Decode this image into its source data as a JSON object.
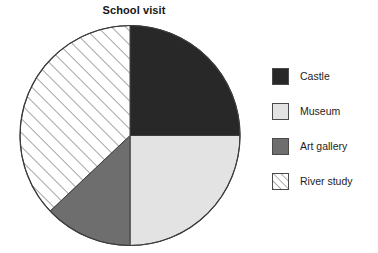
{
  "chart_data": {
    "type": "pie",
    "title": "School visit",
    "categories": [
      "Castle",
      "Museum",
      "Art gallery",
      "River study"
    ],
    "values": [
      25,
      25,
      13,
      37
    ],
    "unit": "percent",
    "total": 100,
    "start_angle_deg": 0,
    "direction": "clockwise",
    "legend_position": "right",
    "grid": false,
    "xlabel": "",
    "ylabel": "",
    "slices": [
      {
        "label": "Castle",
        "value": 25,
        "start_deg": 0,
        "end_deg": 90,
        "fill": "#282828",
        "pattern": "solid",
        "swatch_icon": "solid-dark-swatch-icon"
      },
      {
        "label": "Museum",
        "value": 25,
        "start_deg": 90,
        "end_deg": 180,
        "fill": "#e3e3e3",
        "pattern": "solid",
        "swatch_icon": "solid-light-swatch-icon"
      },
      {
        "label": "Art gallery",
        "value": 13,
        "start_deg": 180,
        "end_deg": 226.6,
        "fill": "#6e6e6e",
        "pattern": "solid",
        "swatch_icon": "solid-mid-swatch-icon"
      },
      {
        "label": "River study",
        "value": 37,
        "start_deg": 226.6,
        "end_deg": 360,
        "fill": "#ffffff",
        "pattern": "diagonal-hatch",
        "swatch_icon": "hatched-swatch-icon"
      }
    ]
  },
  "colors": {
    "castle": "#282828",
    "museum": "#e3e3e3",
    "art_gallery": "#6e6e6e",
    "river_study_fill": "#ffffff",
    "hatch_line": "#5a5a5a",
    "outline": "#3c3c3c",
    "background": "#ffffff",
    "text": "#1d1d1d"
  },
  "geometry": {
    "center_x": 130,
    "center_y": 135.5,
    "radius": 110
  },
  "legend": {
    "items": [
      {
        "label": "Castle"
      },
      {
        "label": "Museum"
      },
      {
        "label": "Art gallery"
      },
      {
        "label": "River study"
      }
    ]
  }
}
